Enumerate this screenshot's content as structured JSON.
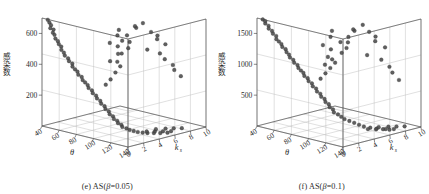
{
  "figure": {
    "panel_count": 2,
    "background_color": "#ffffff",
    "marker_color": "#4a4a4a",
    "axis_color": "#3a3a3a",
    "grid_color": "#b9b9b9"
  },
  "panels": [
    {
      "caption_index": "(e)",
      "caption_prefix": "(e) AS(",
      "caption_symbol": "β",
      "caption_suffix": "=0.05)",
      "caption_full": "(e) AS(β=0.05)",
      "ylabel": "感染数",
      "xlabel": "θ",
      "zlabel": "k",
      "zlabel_sub": "s",
      "y_ticks": [
        "200",
        "400",
        "600"
      ],
      "x_ticks": [
        "40",
        "60",
        "80",
        "100",
        "120",
        "140"
      ],
      "z_ticks": [
        "0",
        "2",
        "4",
        "6",
        "8",
        "10"
      ],
      "x_origin_tick": "0"
    },
    {
      "caption_index": "(f)",
      "caption_prefix": "(f) AS(",
      "caption_symbol": "β",
      "caption_suffix": "=0.1)",
      "caption_full": "(f) AS(β=0.1)",
      "ylabel": "感染数",
      "xlabel": "θ",
      "zlabel": "k",
      "zlabel_sub": "s",
      "y_ticks": [
        "500",
        "1000",
        "1500"
      ],
      "x_ticks": [
        "40",
        "60",
        "80",
        "100",
        "120",
        "140"
      ],
      "z_ticks": [
        "0",
        "2",
        "4",
        "6",
        "8",
        "10"
      ],
      "x_origin_tick": "0"
    }
  ],
  "chart_data": [
    {
      "type": "scatter",
      "title": "(e) AS(β=0.05)",
      "xlabel": "θ",
      "ylabel": "感染数",
      "zlabel": "k_s",
      "xlim": [
        40,
        140
      ],
      "ylim": [
        0,
        10
      ],
      "zlim": [
        0,
        700
      ],
      "grid": true,
      "legend": "none",
      "axis_labels": {
        "x_ticks": [
          40,
          60,
          80,
          100,
          120,
          140
        ],
        "y_ticks": [
          0,
          2,
          4,
          6,
          8,
          10
        ],
        "z_ticks": [
          200,
          400,
          600
        ]
      },
      "points": [
        {
          "theta": 44,
          "ks": 0.3,
          "infected": 690
        },
        {
          "theta": 45,
          "ks": 0.4,
          "infected": 672
        },
        {
          "theta": 46,
          "ks": 0.5,
          "infected": 655
        },
        {
          "theta": 47,
          "ks": 0.3,
          "infected": 640
        },
        {
          "theta": 48,
          "ks": 0.6,
          "infected": 628
        },
        {
          "theta": 49,
          "ks": 0.4,
          "infected": 612
        },
        {
          "theta": 50,
          "ks": 0.5,
          "infected": 598
        },
        {
          "theta": 52,
          "ks": 0.4,
          "infected": 578
        },
        {
          "theta": 53,
          "ks": 0.6,
          "infected": 560
        },
        {
          "theta": 55,
          "ks": 0.5,
          "infected": 545
        },
        {
          "theta": 56,
          "ks": 0.7,
          "infected": 528
        },
        {
          "theta": 58,
          "ks": 0.5,
          "infected": 512
        },
        {
          "theta": 60,
          "ks": 0.6,
          "infected": 495
        },
        {
          "theta": 62,
          "ks": 0.5,
          "infected": 480
        },
        {
          "theta": 64,
          "ks": 0.7,
          "infected": 462
        },
        {
          "theta": 66,
          "ks": 0.6,
          "infected": 448
        },
        {
          "theta": 68,
          "ks": 0.8,
          "infected": 432
        },
        {
          "theta": 70,
          "ks": 0.6,
          "infected": 418
        },
        {
          "theta": 72,
          "ks": 0.7,
          "infected": 402
        },
        {
          "theta": 74,
          "ks": 0.8,
          "infected": 388
        },
        {
          "theta": 76,
          "ks": 0.7,
          "infected": 372
        },
        {
          "theta": 78,
          "ks": 0.9,
          "infected": 358
        },
        {
          "theta": 80,
          "ks": 0.8,
          "infected": 342
        },
        {
          "theta": 82,
          "ks": 0.9,
          "infected": 328
        },
        {
          "theta": 84,
          "ks": 1.0,
          "infected": 312
        },
        {
          "theta": 86,
          "ks": 0.9,
          "infected": 298
        },
        {
          "theta": 88,
          "ks": 1.1,
          "infected": 282
        },
        {
          "theta": 90,
          "ks": 1.0,
          "infected": 268
        },
        {
          "theta": 92,
          "ks": 1.2,
          "infected": 252
        },
        {
          "theta": 94,
          "ks": 1.1,
          "infected": 238
        },
        {
          "theta": 96,
          "ks": 1.3,
          "infected": 222
        },
        {
          "theta": 98,
          "ks": 1.2,
          "infected": 208
        },
        {
          "theta": 100,
          "ks": 1.4,
          "infected": 192
        },
        {
          "theta": 102,
          "ks": 1.3,
          "infected": 178
        },
        {
          "theta": 104,
          "ks": 1.5,
          "infected": 162
        },
        {
          "theta": 106,
          "ks": 1.4,
          "infected": 148
        },
        {
          "theta": 108,
          "ks": 1.6,
          "infected": 135
        },
        {
          "theta": 110,
          "ks": 1.5,
          "infected": 122
        },
        {
          "theta": 112,
          "ks": 1.7,
          "infected": 110
        },
        {
          "theta": 114,
          "ks": 1.6,
          "infected": 98
        },
        {
          "theta": 116,
          "ks": 1.8,
          "infected": 88
        },
        {
          "theta": 118,
          "ks": 1.7,
          "infected": 78
        },
        {
          "theta": 120,
          "ks": 2.0,
          "infected": 68
        },
        {
          "theta": 122,
          "ks": 2.2,
          "infected": 58
        },
        {
          "theta": 124,
          "ks": 2.5,
          "infected": 50
        },
        {
          "theta": 126,
          "ks": 2.8,
          "infected": 42
        },
        {
          "theta": 128,
          "ks": 3.2,
          "infected": 36
        },
        {
          "theta": 130,
          "ks": 3.6,
          "infected": 30
        },
        {
          "theta": 132,
          "ks": 4.2,
          "infected": 25
        },
        {
          "theta": 134,
          "ks": 4.8,
          "infected": 20
        },
        {
          "theta": 136,
          "ks": 5.5,
          "infected": 16
        },
        {
          "theta": 120,
          "ks": 4.6,
          "infected": 14
        },
        {
          "theta": 124,
          "ks": 5.2,
          "infected": 12
        },
        {
          "theta": 128,
          "ks": 5.8,
          "infected": 10
        },
        {
          "theta": 132,
          "ks": 6.4,
          "infected": 9
        },
        {
          "theta": 118,
          "ks": 6.0,
          "infected": 8
        },
        {
          "theta": 122,
          "ks": 6.8,
          "infected": 7
        },
        {
          "theta": 126,
          "ks": 7.4,
          "infected": 6
        },
        {
          "theta": 130,
          "ks": 8.0,
          "infected": 5
        },
        {
          "theta": 96,
          "ks": 2.0,
          "infected": 318
        },
        {
          "theta": 98,
          "ks": 2.4,
          "infected": 350
        },
        {
          "theta": 100,
          "ks": 2.8,
          "infected": 392
        },
        {
          "theta": 102,
          "ks": 3.2,
          "infected": 430
        },
        {
          "theta": 104,
          "ks": 2.6,
          "infected": 470
        },
        {
          "theta": 100,
          "ks": 3.6,
          "infected": 505
        },
        {
          "theta": 104,
          "ks": 4.0,
          "infected": 540
        },
        {
          "theta": 102,
          "ks": 4.4,
          "infected": 572
        },
        {
          "theta": 106,
          "ks": 3.0,
          "infected": 604
        },
        {
          "theta": 108,
          "ks": 3.4,
          "infected": 636
        },
        {
          "theta": 106,
          "ks": 4.8,
          "infected": 664
        },
        {
          "theta": 110,
          "ks": 4.2,
          "infected": 688
        },
        {
          "theta": 112,
          "ks": 5.0,
          "infected": 700
        },
        {
          "theta": 92,
          "ks": 3.0,
          "infected": 452
        },
        {
          "theta": 94,
          "ks": 3.8,
          "infected": 492
        },
        {
          "theta": 90,
          "ks": 4.2,
          "infected": 530
        },
        {
          "theta": 88,
          "ks": 3.4,
          "infected": 560
        },
        {
          "theta": 86,
          "ks": 4.6,
          "infected": 590
        },
        {
          "theta": 84,
          "ks": 5.0,
          "infected": 618
        },
        {
          "theta": 116,
          "ks": 5.6,
          "infected": 640
        },
        {
          "theta": 118,
          "ks": 6.2,
          "infected": 612
        },
        {
          "theta": 114,
          "ks": 6.6,
          "infected": 578
        },
        {
          "theta": 120,
          "ks": 7.0,
          "infected": 548
        },
        {
          "theta": 108,
          "ks": 6.0,
          "infected": 510
        },
        {
          "theta": 110,
          "ks": 7.4,
          "infected": 470
        },
        {
          "theta": 112,
          "ks": 7.8,
          "infected": 430
        },
        {
          "theta": 116,
          "ks": 8.4,
          "infected": 390
        },
        {
          "theta": 114,
          "ks": 8.8,
          "infected": 350
        },
        {
          "theta": 118,
          "ks": 9.2,
          "infected": 310
        }
      ]
    },
    {
      "type": "scatter",
      "title": "(f) AS(β=0.1)",
      "xlabel": "θ",
      "ylabel": "感染数",
      "zlabel": "k_s",
      "xlim": [
        40,
        140
      ],
      "ylim": [
        0,
        10
      ],
      "zlim": [
        0,
        1750
      ],
      "grid": true,
      "legend": "none",
      "axis_labels": {
        "x_ticks": [
          40,
          60,
          80,
          100,
          120,
          140
        ],
        "y_ticks": [
          0,
          2,
          4,
          6,
          8,
          10
        ],
        "z_ticks": [
          500,
          1000,
          1500
        ]
      },
      "points": [
        {
          "theta": 44,
          "ks": 0.3,
          "infected": 1730
        },
        {
          "theta": 45,
          "ks": 0.5,
          "infected": 1700
        },
        {
          "theta": 46,
          "ks": 0.4,
          "infected": 1668
        },
        {
          "theta": 48,
          "ks": 0.6,
          "infected": 1632
        },
        {
          "theta": 50,
          "ks": 0.4,
          "infected": 1600
        },
        {
          "theta": 52,
          "ks": 0.6,
          "infected": 1562
        },
        {
          "theta": 54,
          "ks": 0.5,
          "infected": 1528
        },
        {
          "theta": 56,
          "ks": 0.7,
          "infected": 1490
        },
        {
          "theta": 58,
          "ks": 0.5,
          "infected": 1452
        },
        {
          "theta": 60,
          "ks": 0.6,
          "infected": 1418
        },
        {
          "theta": 62,
          "ks": 0.7,
          "infected": 1380
        },
        {
          "theta": 64,
          "ks": 0.6,
          "infected": 1344
        },
        {
          "theta": 66,
          "ks": 0.8,
          "infected": 1308
        },
        {
          "theta": 68,
          "ks": 0.7,
          "infected": 1270
        },
        {
          "theta": 70,
          "ks": 0.8,
          "infected": 1232
        },
        {
          "theta": 72,
          "ks": 0.7,
          "infected": 1196
        },
        {
          "theta": 74,
          "ks": 0.9,
          "infected": 1158
        },
        {
          "theta": 76,
          "ks": 0.8,
          "infected": 1122
        },
        {
          "theta": 78,
          "ks": 1.0,
          "infected": 1084
        },
        {
          "theta": 80,
          "ks": 0.9,
          "infected": 1048
        },
        {
          "theta": 82,
          "ks": 1.0,
          "infected": 1010
        },
        {
          "theta": 84,
          "ks": 1.1,
          "infected": 974
        },
        {
          "theta": 86,
          "ks": 1.0,
          "infected": 936
        },
        {
          "theta": 88,
          "ks": 1.2,
          "infected": 900
        },
        {
          "theta": 90,
          "ks": 1.1,
          "infected": 862
        },
        {
          "theta": 92,
          "ks": 1.3,
          "infected": 826
        },
        {
          "theta": 94,
          "ks": 1.2,
          "infected": 788
        },
        {
          "theta": 96,
          "ks": 1.4,
          "infected": 752
        },
        {
          "theta": 98,
          "ks": 1.3,
          "infected": 714
        },
        {
          "theta": 100,
          "ks": 1.5,
          "infected": 678
        },
        {
          "theta": 102,
          "ks": 1.4,
          "infected": 640
        },
        {
          "theta": 104,
          "ks": 1.6,
          "infected": 604
        },
        {
          "theta": 106,
          "ks": 1.5,
          "infected": 566
        },
        {
          "theta": 108,
          "ks": 1.7,
          "infected": 530
        },
        {
          "theta": 110,
          "ks": 1.6,
          "infected": 492
        },
        {
          "theta": 112,
          "ks": 1.8,
          "infected": 456
        },
        {
          "theta": 114,
          "ks": 1.7,
          "infected": 418
        },
        {
          "theta": 116,
          "ks": 2.0,
          "infected": 382
        },
        {
          "theta": 118,
          "ks": 2.2,
          "infected": 344
        },
        {
          "theta": 120,
          "ks": 2.4,
          "infected": 308
        },
        {
          "theta": 122,
          "ks": 2.8,
          "infected": 270
        },
        {
          "theta": 124,
          "ks": 3.2,
          "infected": 234
        },
        {
          "theta": 126,
          "ks": 3.6,
          "infected": 196
        },
        {
          "theta": 128,
          "ks": 4.0,
          "infected": 160
        },
        {
          "theta": 130,
          "ks": 4.6,
          "infected": 130
        },
        {
          "theta": 132,
          "ks": 5.2,
          "infected": 104
        },
        {
          "theta": 134,
          "ks": 5.8,
          "infected": 80
        },
        {
          "theta": 136,
          "ks": 6.4,
          "infected": 60
        },
        {
          "theta": 120,
          "ks": 5.4,
          "infected": 48
        },
        {
          "theta": 124,
          "ks": 6.0,
          "infected": 38
        },
        {
          "theta": 128,
          "ks": 6.8,
          "infected": 30
        },
        {
          "theta": 132,
          "ks": 7.4,
          "infected": 24
        },
        {
          "theta": 118,
          "ks": 7.0,
          "infected": 20
        },
        {
          "theta": 122,
          "ks": 7.8,
          "infected": 16
        },
        {
          "theta": 126,
          "ks": 8.4,
          "infected": 12
        },
        {
          "theta": 130,
          "ks": 9.0,
          "infected": 10
        },
        {
          "theta": 94,
          "ks": 2.2,
          "infected": 880
        },
        {
          "theta": 96,
          "ks": 2.6,
          "infected": 960
        },
        {
          "theta": 98,
          "ks": 3.0,
          "infected": 1040
        },
        {
          "theta": 100,
          "ks": 3.4,
          "infected": 1120
        },
        {
          "theta": 102,
          "ks": 2.8,
          "infected": 1200
        },
        {
          "theta": 104,
          "ks": 3.8,
          "infected": 1280
        },
        {
          "theta": 106,
          "ks": 4.2,
          "infected": 1352
        },
        {
          "theta": 104,
          "ks": 4.6,
          "infected": 1424
        },
        {
          "theta": 108,
          "ks": 3.2,
          "infected": 1488
        },
        {
          "theta": 110,
          "ks": 4.0,
          "infected": 1552
        },
        {
          "theta": 108,
          "ks": 5.0,
          "infected": 1612
        },
        {
          "theta": 112,
          "ks": 4.4,
          "infected": 1668
        },
        {
          "theta": 114,
          "ks": 5.4,
          "infected": 1716
        },
        {
          "theta": 90,
          "ks": 3.2,
          "infected": 1060
        },
        {
          "theta": 88,
          "ks": 3.8,
          "infected": 1160
        },
        {
          "theta": 86,
          "ks": 4.4,
          "infected": 1256
        },
        {
          "theta": 84,
          "ks": 3.6,
          "infected": 1344
        },
        {
          "theta": 82,
          "ks": 4.8,
          "infected": 1432
        },
        {
          "theta": 80,
          "ks": 5.2,
          "infected": 1510
        },
        {
          "theta": 116,
          "ks": 6.0,
          "infected": 1590
        },
        {
          "theta": 118,
          "ks": 6.6,
          "infected": 1500
        },
        {
          "theta": 114,
          "ks": 7.0,
          "infected": 1400
        },
        {
          "theta": 120,
          "ks": 7.6,
          "infected": 1300
        },
        {
          "theta": 110,
          "ks": 6.4,
          "infected": 1180
        },
        {
          "theta": 112,
          "ks": 8.0,
          "infected": 1060
        },
        {
          "theta": 116,
          "ks": 8.6,
          "infected": 940
        },
        {
          "theta": 114,
          "ks": 9.2,
          "infected": 820
        },
        {
          "theta": 118,
          "ks": 9.6,
          "infected": 700
        }
      ]
    }
  ]
}
